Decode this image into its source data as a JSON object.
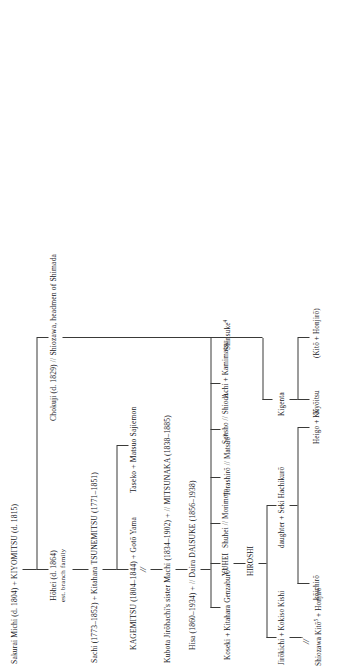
{
  "chart": {
    "generations": [
      {
        "id": "gen1",
        "nodes": [
          {
            "id": "kiyomitsu",
            "label": "Sakurai Michi (d. 1804) + KIYOMITSU (d. 1815)"
          }
        ]
      },
      {
        "id": "gen2",
        "nodes": [
          {
            "id": "hohei",
            "label": "Hōhei (d. 1864)",
            "sub": "est. branch family"
          },
          {
            "id": "chokuji",
            "label": "Chokuji (d. 1829) // Shiozawa, headmen of Shimada"
          }
        ]
      },
      {
        "id": "gen3",
        "nodes": [
          {
            "id": "sachi",
            "label": "Sachi (1773–1852) + Kitahara TSUNEMITSU (1771–1851)"
          }
        ]
      },
      {
        "id": "gen4",
        "nodes": [
          {
            "id": "kagemitsu",
            "label": "KAGEMITSU (1804–1844) + Gotō Yama"
          },
          {
            "id": "taseko",
            "label": "Taseko + Matsuo Sajiemon"
          }
        ]
      },
      {
        "id": "gen5",
        "nodes": [
          {
            "id": "mitsunaka",
            "label": "Kubota Jirōhachi's sister Machi (1834–1902) + // MITSUNAKA (1838–1885)"
          }
        ]
      },
      {
        "id": "gen6",
        "nodes": [
          {
            "id": "hisa",
            "label": "Hisa (1860–1934) + // Daira DAISUKE (1856–1938)"
          }
        ]
      },
      {
        "id": "gen7",
        "nodes": [
          {
            "id": "koseki",
            "label": "Koseki + Kitahara Genzaburō",
            "note": "2"
          },
          {
            "id": "yuhei",
            "label": "YUHEI"
          },
          {
            "id": "shuhei",
            "label": "Shuhei // Morimoto"
          },
          {
            "id": "torashiro",
            "label": "Torashirō // Matsuo",
            "note": "3"
          },
          {
            "id": "sensho",
            "label": "Sensho // Shioda"
          },
          {
            "id": "achi",
            "label": "Achi + Kamimatsu"
          },
          {
            "id": "shinsuke",
            "label": "Shinsuke",
            "note": "4"
          }
        ]
      },
      {
        "id": "gen8",
        "nodes": [
          {
            "id": "hiroshi",
            "label": "HIROSHI"
          }
        ]
      },
      {
        "id": "gen9",
        "nodes": [
          {
            "id": "jirokichi",
            "label": "Jirōkichi + Kokiso Kishi"
          },
          {
            "id": "daughter",
            "label": "daughter + Seki Hachikurō"
          },
          {
            "id": "kigenta",
            "label": "Kigenta"
          }
        ]
      },
      {
        "id": "gen10",
        "nodes": [
          {
            "id": "shiozawa-kito",
            "label": "Shiozawa Kitō",
            "note": "5",
            "suffix": " + Honjirō"
          },
          {
            "id": "koichiro",
            "label": "kōichirō"
          },
          {
            "id": "heigo",
            "label": "Heigo + Kō"
          },
          {
            "id": "kyoitsu",
            "label": "Kyōitsu"
          },
          {
            "id": "kito-honjiro",
            "label": "(Kitō + Honjirō)"
          }
        ]
      }
    ],
    "marks": {
      "adoption_slash": "//",
      "adoption_double_slash_symbol": "//"
    }
  },
  "colors": {
    "ink": "#20201e",
    "rule": "#3a3a38",
    "paper": "#ffffff"
  }
}
